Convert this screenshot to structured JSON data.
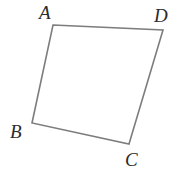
{
  "figure": {
    "name": "quadrilateral-ABCD",
    "width": 185,
    "height": 176,
    "background_color": "#ffffff",
    "stroke_color": "#7d7d7d",
    "stroke_width": 1.6,
    "fill": "none",
    "label_color": "#2b2b2b",
    "label_font_size": 19,
    "label_style": "italic-serif"
  },
  "shape": {
    "type": "quadrilateral",
    "closed": true,
    "vertex_order": [
      "A",
      "D",
      "C",
      "B"
    ],
    "path": "M 53 25 L 163 30 L 129 144 L 32 123 Z",
    "vertices": [
      {
        "id": "A",
        "label": "A",
        "x": 53,
        "y": 25
      },
      {
        "id": "D",
        "label": "D",
        "x": 163,
        "y": 30
      },
      {
        "id": "C",
        "label": "C",
        "x": 129,
        "y": 144
      },
      {
        "id": "B",
        "label": "B",
        "x": 32,
        "y": 123
      }
    ],
    "edges": [
      {
        "id": "AD",
        "from": "A",
        "to": "D"
      },
      {
        "id": "DC",
        "from": "D",
        "to": "C"
      },
      {
        "id": "CB",
        "from": "C",
        "to": "B"
      },
      {
        "id": "BA",
        "from": "B",
        "to": "A"
      }
    ]
  },
  "labels": {
    "A": "A",
    "B": "B",
    "C": "C",
    "D": "D"
  }
}
